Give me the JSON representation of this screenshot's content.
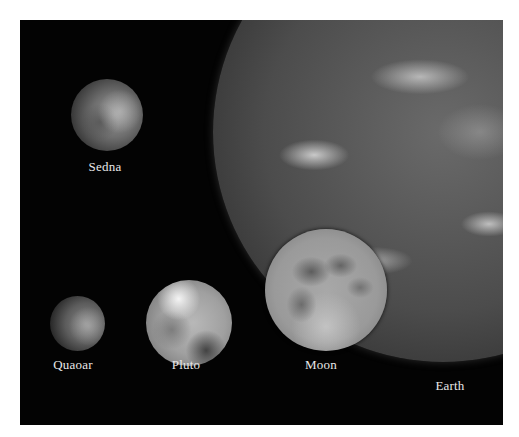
{
  "figure": {
    "background_color": "#030303",
    "bodies": [
      {
        "id": "sedna",
        "label": "Sedna"
      },
      {
        "id": "quaoar",
        "label": "Quaoar"
      },
      {
        "id": "pluto",
        "label": "Pluto"
      },
      {
        "id": "moon",
        "label": "Moon"
      },
      {
        "id": "earth",
        "label": "Earth"
      }
    ]
  }
}
